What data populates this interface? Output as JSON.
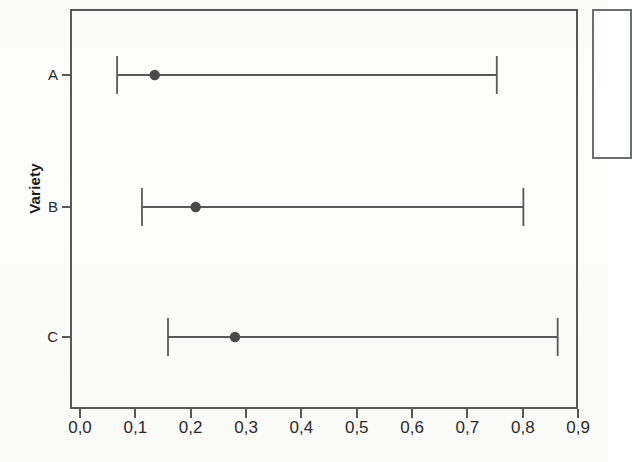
{
  "chart_data": {
    "type": "scatter",
    "title": "",
    "subtitle": "",
    "xlabel": "",
    "ylabel": "Variety",
    "orientation": "horizontal",
    "grid": false,
    "legend_position": "right",
    "xlim": [
      0.0,
      0.9
    ],
    "x_ticks": [
      0.0,
      0.1,
      0.2,
      0.3,
      0.4,
      0.5,
      0.6,
      0.7,
      0.8,
      0.9
    ],
    "x_tick_labels": [
      "0,0",
      "0,1",
      "0,2",
      "0,3",
      "0,4",
      "0,5",
      "0,6",
      "0,7",
      "0,8",
      "0,9"
    ],
    "decimal_separator": ",",
    "categories": [
      "A",
      "B",
      "C"
    ],
    "series": [
      {
        "name": "Mean with interval",
        "marker": "filled-circle",
        "color": "#4a4a4a",
        "points": [
          {
            "category": "A",
            "value": 0.135,
            "low": 0.067,
            "high": 0.753
          },
          {
            "category": "B",
            "value": 0.209,
            "low": 0.112,
            "high": 0.801
          },
          {
            "category": "C",
            "value": 0.28,
            "low": 0.159,
            "high": 0.863
          }
        ]
      }
    ],
    "values": [
      0.135,
      0.209,
      0.28
    ],
    "error_low": [
      0.067,
      0.112,
      0.159
    ],
    "error_high": [
      0.753,
      0.801,
      0.863
    ]
  },
  "axes": {
    "y_title": "Variety",
    "y_tick_labels": [
      "A",
      "B",
      "C"
    ],
    "x_tick_labels": [
      "0,0",
      "0,1",
      "0,2",
      "0,3",
      "0,4",
      "0,5",
      "0,6",
      "0,7",
      "0,8",
      "0,9"
    ]
  },
  "style": {
    "frame_color": "#58595b",
    "marker_color": "#4a4a4a",
    "line_color": "#58595b",
    "text_color": "#2a2a2a",
    "background": "#fdfdfc"
  },
  "legend": {
    "visible": true,
    "cropped": true,
    "entries": []
  }
}
